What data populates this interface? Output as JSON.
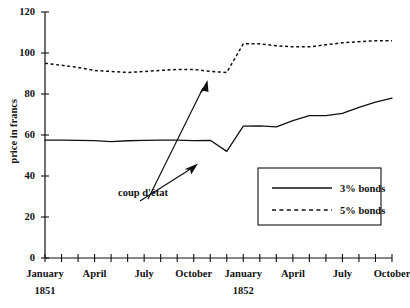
{
  "chart_data": {
    "type": "line",
    "title": "",
    "xlabel": "",
    "ylabel": "price in francs",
    "ylim": [
      0,
      120
    ],
    "ytick_values": [
      0,
      20,
      40,
      60,
      80,
      100,
      120
    ],
    "ytick_labels": [
      "0",
      "20",
      "40",
      "60",
      "80",
      "100",
      "120"
    ],
    "grid": false,
    "legend_position": "lower-right",
    "x": [
      "Jan 1851",
      "Feb 1851",
      "Mar 1851",
      "Apr 1851",
      "May 1851",
      "Jun 1851",
      "Jul 1851",
      "Aug 1851",
      "Sep 1851",
      "Oct 1851",
      "Nov 1851",
      "Dec 1851",
      "Jan 1852",
      "Feb 1852",
      "Mar 1852",
      "Apr 1852",
      "May 1852",
      "Jun 1852",
      "Jul 1852",
      "Aug 1852",
      "Sep 1852",
      "Oct 1852"
    ],
    "xtick_labels": [
      {
        "label": "January",
        "sub": "1851",
        "index": 0
      },
      {
        "label": "April",
        "sub": "",
        "index": 3
      },
      {
        "label": "July",
        "sub": "",
        "index": 6
      },
      {
        "label": "October",
        "sub": "",
        "index": 9
      },
      {
        "label": "January",
        "sub": "1852",
        "index": 12
      },
      {
        "label": "April",
        "sub": "",
        "index": 15
      },
      {
        "label": "July",
        "sub": "",
        "index": 18
      },
      {
        "label": "October",
        "sub": "",
        "index": 21
      }
    ],
    "series": [
      {
        "name": "3% bonds",
        "style": "solid",
        "values": [
          57.5,
          57.5,
          57.4,
          57.3,
          56.8,
          57.2,
          57.4,
          57.5,
          57.5,
          57.3,
          57.4,
          52.0,
          64.3,
          64.5,
          64.0,
          67.0,
          69.5,
          69.5,
          70.5,
          73.5,
          76.0,
          78.0
        ]
      },
      {
        "name": "5% bonds",
        "style": "dashed",
        "values": [
          95.0,
          94.0,
          93.0,
          91.5,
          91.0,
          90.5,
          91.0,
          91.5,
          92.0,
          92.0,
          91.0,
          90.5,
          104.5,
          104.5,
          103.5,
          103.0,
          103.0,
          104.0,
          105.0,
          105.5,
          106.0,
          106.0
        ]
      }
    ],
    "annotations": [
      {
        "text": "coup d'état",
        "x_index": 11,
        "y_value": 52.0
      }
    ],
    "legend": [
      {
        "label": "3% bonds",
        "style": "solid"
      },
      {
        "label": "5% bonds",
        "style": "dashed"
      }
    ]
  },
  "axes": {
    "y_title": "price in francs"
  }
}
